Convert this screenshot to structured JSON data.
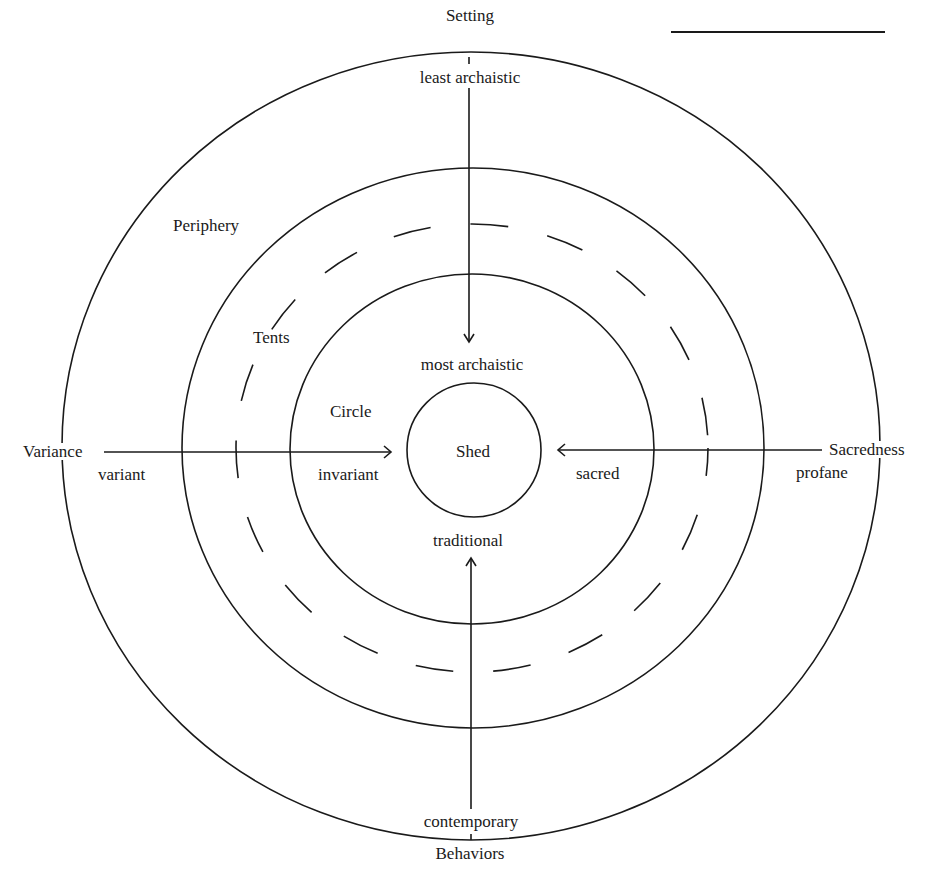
{
  "diagram": {
    "type": "concentric-zones",
    "line_color": "#1a1a1a",
    "zones": [
      {
        "name": "Shed",
        "label": "Shed"
      },
      {
        "name": "Circle",
        "label": "Circle"
      },
      {
        "name": "Tents",
        "label": "Tents"
      },
      {
        "name": "Periphery",
        "label": "Periphery"
      }
    ],
    "axes": {
      "setting": {
        "title": "Setting",
        "outer": "least archaistic",
        "inner": "most archaistic"
      },
      "behaviors": {
        "title": "Behaviors",
        "outer": "contemporary",
        "inner": "traditional"
      },
      "variance": {
        "title": "Variance",
        "outer": "variant",
        "inner": "invariant"
      },
      "sacredness": {
        "title": "Sacredness",
        "outer": "profane",
        "inner": "sacred"
      }
    }
  }
}
